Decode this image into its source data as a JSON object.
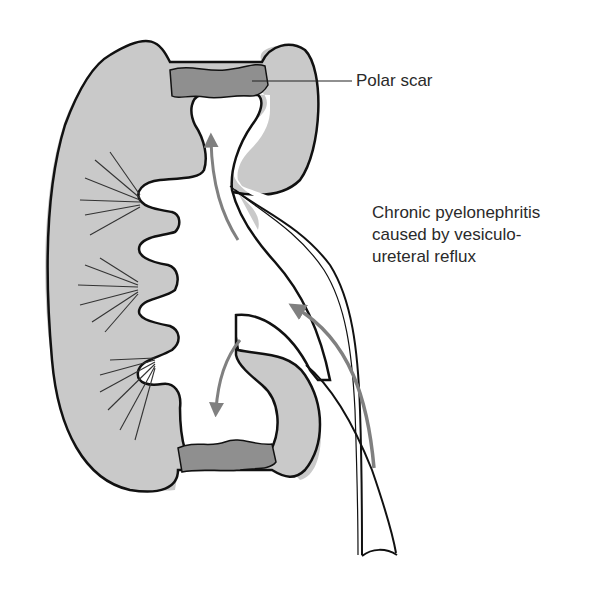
{
  "diagram": {
    "type": "anatomical-illustration",
    "labels": {
      "polar_scar": "Polar scar",
      "caption_line1": "Chronic pyelonephritis",
      "caption_line2": "caused by vesiculo-",
      "caption_line3": "ureteral reflux"
    },
    "colors": {
      "parenchyma": "#c9c9c9",
      "scar": "#8f8f8f",
      "outline": "#111111",
      "arrow": "#808080",
      "background": "#ffffff"
    }
  }
}
